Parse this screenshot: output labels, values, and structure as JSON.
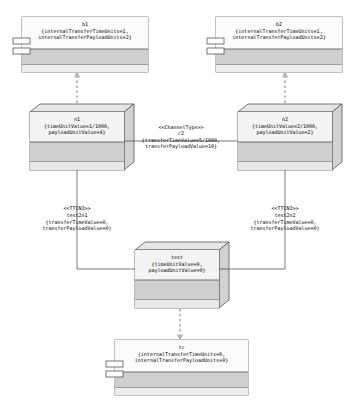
{
  "diagram": {
    "background": "#ffffff",
    "stroke": "#000000",
    "node_fill_top": "#f2f2f2",
    "node_fill_band": "#cfcfcf",
    "node_fill_bottom": "#e3e3e3",
    "artifact_fill": "#f7f7f7"
  },
  "artifacts": [
    {
      "id": "b1",
      "name": "b1",
      "properties": "{internalTransferTimeUnits=1,\ninternalTransferPayloadUnits=2}",
      "icon": "component-icon"
    },
    {
      "id": "b2",
      "name": "b2",
      "properties": "{internalTransferTimeUnits=1,\ninternalTransferPayloadUnits=2}",
      "icon": "component-icon"
    },
    {
      "id": "tc",
      "name": "tc",
      "properties": "{internalTransferTimeUnits=0,\ninternalTransferPayloadUnits=0}",
      "icon": "component-icon"
    }
  ],
  "nodes": [
    {
      "id": "n1",
      "name": "n1",
      "properties": "{timeUnitValue=1/1000,\npayloadUnitValue=4}"
    },
    {
      "id": "n2",
      "name": "n2",
      "properties": "{timeUnitValue=2/1000,\npayloadUnitValue=2}"
    },
    {
      "id": "test",
      "name": "test",
      "properties": "{timeUnitValue=0,\npayloadUnitValue=0}"
    }
  ],
  "connectors": [
    {
      "id": "c2",
      "stereotype": "<<ChannelType>>",
      "name": "c2",
      "properties": "{transferTimeValue=5/1000,\ntransferPayloadValue=10}",
      "from": "n1",
      "to": "n2"
    },
    {
      "id": "test2n1",
      "stereotype": "<<TTCN3>>",
      "name": "test2n1",
      "properties": "{transferTimeValue=0,\ntransferPayloadValue=0}",
      "from": "test",
      "to": "n1"
    },
    {
      "id": "test2n2",
      "stereotype": "<<TTCN3>>",
      "name": "test2n2",
      "properties": "{transferTimeValue=0,\ntransferPayloadValue=0}",
      "from": "test",
      "to": "n2"
    }
  ],
  "dependencies": [
    {
      "from": "n1",
      "to": "b1",
      "style": "dashed-open-arrow"
    },
    {
      "from": "n2",
      "to": "b2",
      "style": "dashed-open-arrow"
    },
    {
      "from": "test",
      "to": "tc",
      "style": "dashed-open-arrow"
    }
  ]
}
